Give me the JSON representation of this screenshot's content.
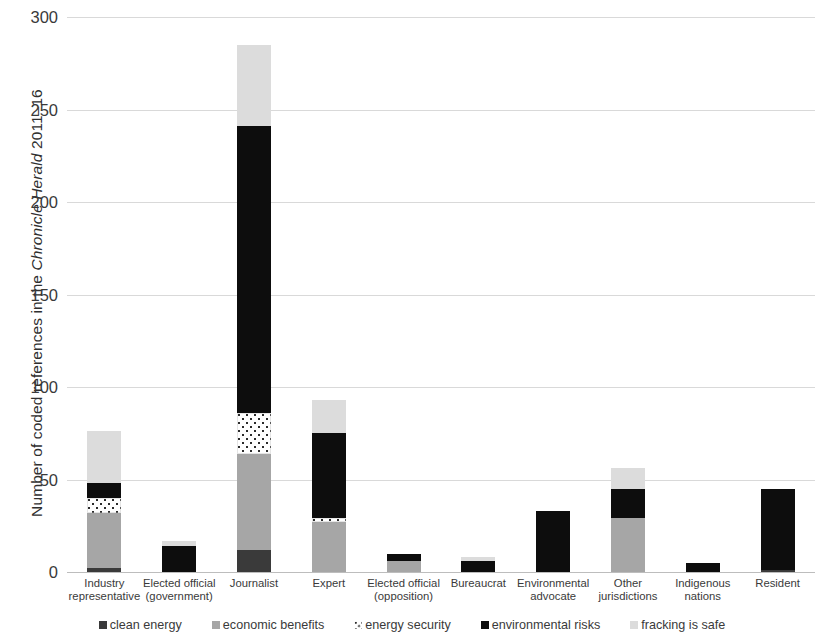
{
  "chart_data": {
    "type": "bar",
    "stacked": true,
    "title": "",
    "xlabel": "",
    "ylabel": "Number of coded references in the Chronicle Herald 2011–16",
    "ylabel_italic_part": "Chronicle Herald",
    "ylim": [
      0,
      300
    ],
    "yticks": [
      0,
      50,
      100,
      150,
      200,
      250,
      300
    ],
    "grid": "horizontal",
    "legend_position": "bottom",
    "categories": [
      "Industry\nrepresentative",
      "Elected official\n(government)",
      "Journalist",
      "Expert",
      "Elected official\n(opposition)",
      "Bureaucrat",
      "Environmental\nadvocate",
      "Other\njurisdictions",
      "Indigenous\nnations",
      "Resident"
    ],
    "series": [
      {
        "name": "clean energy",
        "color": "#3a3a3a",
        "pattern": "solid-dark",
        "values": [
          2,
          0,
          12,
          0,
          0,
          0,
          0,
          0,
          0,
          1
        ]
      },
      {
        "name": "economic benefits",
        "color": "#a6a6a6",
        "pattern": "solid-gray",
        "values": [
          30,
          0,
          52,
          27,
          6,
          0,
          0,
          29,
          0,
          0
        ]
      },
      {
        "name": "energy security",
        "color": "#2b2b2b",
        "pattern": "dotted",
        "values": [
          8,
          0,
          22,
          2,
          0,
          0,
          0,
          0,
          0,
          0
        ]
      },
      {
        "name": "environmental risks",
        "color": "#0d0d0d",
        "pattern": "solid-black",
        "values": [
          8,
          14,
          155,
          46,
          4,
          6,
          33,
          16,
          5,
          44
        ]
      },
      {
        "name": "fracking is safe",
        "color": "#dcdcdc",
        "pattern": "solid-light",
        "values": [
          28,
          3,
          44,
          18,
          0,
          2,
          0,
          11,
          0,
          0
        ]
      }
    ],
    "totals": [
      76,
      17,
      285,
      93,
      10,
      8,
      33,
      56,
      5,
      45
    ]
  },
  "legend": {
    "items": [
      {
        "label": "clean energy",
        "swatch": "swatch-clean-energy"
      },
      {
        "label": "economic benefits",
        "swatch": "swatch-economic-benefits"
      },
      {
        "label": "energy security",
        "swatch": "swatch-energy-security"
      },
      {
        "label": "environmental risks",
        "swatch": "swatch-environmental-risks"
      },
      {
        "label": "fracking is safe",
        "swatch": "swatch-fracking-is-safe"
      }
    ]
  },
  "axis": {
    "y_title_prefix": "Number of coded references in the ",
    "y_title_italic": "Chronicle Herald",
    "y_title_suffix": " 2011–16",
    "y_tick_labels": [
      "300",
      "250",
      "200",
      "150",
      "100",
      "50",
      "0"
    ]
  }
}
